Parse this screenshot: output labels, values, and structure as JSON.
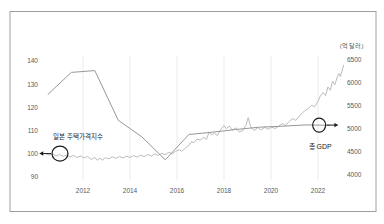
{
  "panel": {
    "background": "#ffffff",
    "frame_color": "#a0a0a0"
  },
  "colors": {
    "gdp_line": "#979797",
    "housing_line": "#bcbcbc",
    "grid": "#ebebeb",
    "tick_text": "#5a5a5a",
    "annotation": "#1c1c1c"
  },
  "chart_data": {
    "type": "line",
    "title": "",
    "grid": "vertical-only",
    "legend": "none-inline-annotations",
    "x_axis": {
      "ticks": [
        2012,
        2014,
        2016,
        2018,
        2020,
        2022
      ],
      "range": [
        2010.2,
        2023.3
      ]
    },
    "left_axis": {
      "ticks": [
        90,
        100,
        110,
        120,
        130,
        140
      ],
      "range": [
        90,
        140
      ],
      "unit_label": ""
    },
    "right_axis": {
      "ticks": [
        4000,
        4500,
        5000,
        5500,
        6000,
        6500
      ],
      "range": [
        4000,
        6500
      ],
      "unit_label": "(억 달러)"
    },
    "series": [
      {
        "name": "일본 주택가격지수",
        "axis": "left",
        "style": "noisy-monthly",
        "x_offset": 0,
        "points": [
          [
            2010.4,
            100.1
          ],
          [
            2010.55,
            99.5
          ],
          [
            2010.7,
            100.0
          ],
          [
            2010.85,
            99.1
          ],
          [
            2011.0,
            99.7
          ],
          [
            2011.15,
            98.9
          ],
          [
            2011.3,
            99.5
          ],
          [
            2011.45,
            98.7
          ],
          [
            2011.6,
            99.3
          ],
          [
            2011.75,
            98.4
          ],
          [
            2011.9,
            99.1
          ],
          [
            2012.05,
            98.2
          ],
          [
            2012.2,
            98.9
          ],
          [
            2012.35,
            97.6
          ],
          [
            2012.5,
            98.4
          ],
          [
            2012.6,
            97.2
          ],
          [
            2012.72,
            98.1
          ],
          [
            2012.82,
            97.3
          ],
          [
            2012.95,
            98.3
          ],
          [
            2013.1,
            97.8
          ],
          [
            2013.25,
            98.7
          ],
          [
            2013.4,
            98.0
          ],
          [
            2013.55,
            98.9
          ],
          [
            2013.7,
            98.2
          ],
          [
            2013.85,
            99.0
          ],
          [
            2014.0,
            98.4
          ],
          [
            2014.15,
            99.2
          ],
          [
            2014.3,
            98.6
          ],
          [
            2014.45,
            99.4
          ],
          [
            2014.6,
            98.8
          ],
          [
            2014.75,
            99.7
          ],
          [
            2014.9,
            99.0
          ],
          [
            2015.05,
            99.9
          ],
          [
            2015.2,
            99.3
          ],
          [
            2015.35,
            100.2
          ],
          [
            2015.5,
            99.6
          ],
          [
            2015.65,
            100.6
          ],
          [
            2015.8,
            100.0
          ],
          [
            2015.95,
            101.1
          ],
          [
            2016.1,
            101.7
          ],
          [
            2016.22,
            101.1
          ],
          [
            2016.35,
            102.4
          ],
          [
            2016.5,
            103.6
          ],
          [
            2016.62,
            105.3
          ],
          [
            2016.72,
            104.8
          ],
          [
            2016.85,
            106.4
          ],
          [
            2017.0,
            105.9
          ],
          [
            2017.12,
            107.1
          ],
          [
            2017.25,
            106.2
          ],
          [
            2017.37,
            109.4
          ],
          [
            2017.47,
            108.2
          ],
          [
            2017.6,
            108.9
          ],
          [
            2017.72,
            107.8
          ],
          [
            2017.85,
            110.4
          ],
          [
            2018.0,
            112.2
          ],
          [
            2018.1,
            110.8
          ],
          [
            2018.22,
            112.0
          ],
          [
            2018.35,
            110.2
          ],
          [
            2018.5,
            111.2
          ],
          [
            2018.65,
            109.4
          ],
          [
            2018.8,
            110.1
          ],
          [
            2018.93,
            112.2
          ],
          [
            2019.03,
            115.6
          ],
          [
            2019.13,
            111.6
          ],
          [
            2019.28,
            110.0
          ],
          [
            2019.43,
            111.3
          ],
          [
            2019.58,
            110.3
          ],
          [
            2019.73,
            111.4
          ],
          [
            2019.88,
            110.6
          ],
          [
            2020.03,
            111.5
          ],
          [
            2020.18,
            110.9
          ],
          [
            2020.33,
            112.0
          ],
          [
            2020.48,
            113.0
          ],
          [
            2020.62,
            112.2
          ],
          [
            2020.78,
            114.0
          ],
          [
            2020.93,
            115.2
          ],
          [
            2021.05,
            114.4
          ],
          [
            2021.2,
            116.2
          ],
          [
            2021.35,
            117.8
          ],
          [
            2021.48,
            118.9
          ],
          [
            2021.6,
            119.6
          ],
          [
            2021.74,
            121.0
          ],
          [
            2021.85,
            120.2
          ],
          [
            2022.0,
            122.6
          ],
          [
            2022.1,
            124.9
          ],
          [
            2022.22,
            126.4
          ],
          [
            2022.32,
            125.1
          ],
          [
            2022.42,
            128.8
          ],
          [
            2022.52,
            127.4
          ],
          [
            2022.62,
            131.3
          ],
          [
            2022.72,
            129.8
          ],
          [
            2022.82,
            133.2
          ],
          [
            2022.89,
            134.6
          ],
          [
            2022.95,
            133.3
          ],
          [
            2023.02,
            135.6
          ],
          [
            2023.1,
            138.4
          ]
        ]
      },
      {
        "name": "총 GDP",
        "axis": "right",
        "style": "smooth-annual",
        "x_offset": 0.5,
        "points": [
          [
            2010,
            5750
          ],
          [
            2011,
            6230
          ],
          [
            2012,
            6270
          ],
          [
            2013,
            5190
          ],
          [
            2014,
            4830
          ],
          [
            2015,
            4330
          ],
          [
            2016,
            4880
          ],
          [
            2017,
            4930
          ],
          [
            2018,
            4990
          ],
          [
            2019,
            5040
          ],
          [
            2020,
            5060
          ],
          [
            2021,
            5090
          ],
          [
            2022,
            5080
          ]
        ]
      }
    ],
    "annotations": [
      {
        "id": "housing",
        "label": "일본 주택가격지수",
        "axis": "left",
        "year": 2011.02,
        "value": 100.1,
        "rx": 8,
        "ry": 7.5,
        "arrow": "left",
        "label_dx": 18,
        "label_dy": -15,
        "font": 6.5
      },
      {
        "id": "gdp",
        "label": "총 GDP",
        "axis": "right",
        "year": 2022.05,
        "value": 5085,
        "rx": 6.5,
        "ry": 7,
        "arrow": "right",
        "label_dx": 1,
        "label_dy": 24,
        "font": 7
      }
    ]
  }
}
